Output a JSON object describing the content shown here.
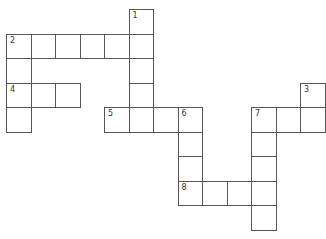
{
  "puzzle": {
    "type": "crossword",
    "origin": {
      "x": 6,
      "y": 9
    },
    "cell_size": 24.5,
    "cells": [
      {
        "r": 0,
        "c": 5,
        "num": "1"
      },
      {
        "r": 1,
        "c": 0,
        "num": "2"
      },
      {
        "r": 1,
        "c": 1
      },
      {
        "r": 1,
        "c": 2
      },
      {
        "r": 1,
        "c": 3
      },
      {
        "r": 1,
        "c": 4
      },
      {
        "r": 1,
        "c": 5
      },
      {
        "r": 2,
        "c": 0
      },
      {
        "r": 2,
        "c": 5
      },
      {
        "r": 3,
        "c": 0,
        "num": "4"
      },
      {
        "r": 3,
        "c": 1
      },
      {
        "r": 3,
        "c": 2
      },
      {
        "r": 3,
        "c": 5
      },
      {
        "r": 3,
        "c": 12,
        "num": "3"
      },
      {
        "r": 4,
        "c": 0
      },
      {
        "r": 4,
        "c": 4,
        "num": "5"
      },
      {
        "r": 4,
        "c": 5
      },
      {
        "r": 4,
        "c": 6
      },
      {
        "r": 4,
        "c": 7,
        "num": "6"
      },
      {
        "r": 4,
        "c": 10,
        "num": "7"
      },
      {
        "r": 4,
        "c": 11
      },
      {
        "r": 4,
        "c": 12
      },
      {
        "r": 5,
        "c": 7
      },
      {
        "r": 5,
        "c": 10
      },
      {
        "r": 6,
        "c": 7
      },
      {
        "r": 6,
        "c": 10
      },
      {
        "r": 7,
        "c": 7,
        "num": "8"
      },
      {
        "r": 7,
        "c": 8
      },
      {
        "r": 7,
        "c": 9
      },
      {
        "r": 7,
        "c": 10
      },
      {
        "r": 8,
        "c": 10
      }
    ],
    "clue_numbers": [
      "1",
      "2",
      "3",
      "4",
      "5",
      "6",
      "7",
      "8"
    ]
  }
}
